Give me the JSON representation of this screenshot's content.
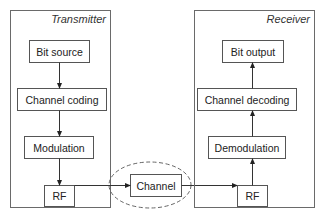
{
  "diagram": {
    "transmitter": {
      "title": "Transmitter",
      "blocks": [
        "Bit source",
        "Channel coding",
        "Modulation",
        "RF"
      ]
    },
    "channel": {
      "label": "Channel"
    },
    "receiver": {
      "title": "Receiver",
      "blocks": [
        "Bit output",
        "Channel decoding",
        "Demodulation",
        "RF"
      ]
    },
    "flow": [
      "Bit source -> Channel coding",
      "Channel coding -> Modulation",
      "Modulation -> RF",
      "RF -> Channel",
      "Channel -> RF",
      "RF -> Demodulation",
      "Demodulation -> Channel decoding",
      "Channel decoding -> Bit output"
    ]
  }
}
